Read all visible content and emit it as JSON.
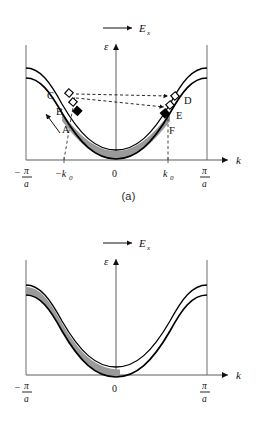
{
  "figure": {
    "panels": [
      {
        "id": "a",
        "caption": "(a)",
        "field_arrow_label": "E",
        "field_arrow_subscript": "x",
        "y_axis_label": "ε",
        "x_axis_label": "k",
        "x_ticks": [
          {
            "id": "neg-pi-a",
            "numerator": "π",
            "denominator": "a",
            "sign": "−",
            "type": "fraction"
          },
          {
            "id": "neg-k0",
            "label": "−k",
            "subscript": "0",
            "type": "symbol"
          },
          {
            "id": "zero",
            "label": "0",
            "type": "plain"
          },
          {
            "id": "pos-k0",
            "label": "k",
            "subscript": "0",
            "type": "symbol"
          },
          {
            "id": "pos-pi-a",
            "numerator": "π",
            "denominator": "a",
            "sign": "",
            "type": "fraction"
          }
        ],
        "point_labels": [
          "C",
          "B",
          "A",
          "D",
          "E",
          "F"
        ],
        "markers": {
          "open_square_count_left": 2,
          "filled_square_count_left": 1,
          "open_square_count_right": 2,
          "filled_square_count_right": 1
        },
        "dashed_transitions": [
          "C→D",
          "B→E"
        ],
        "shaded_region": "symmetric between −k0 and +k0"
      },
      {
        "id": "b",
        "caption": "(b)",
        "field_arrow_label": "E",
        "field_arrow_subscript": "x",
        "y_axis_label": "ε",
        "x_axis_label": "k",
        "x_ticks": [
          {
            "id": "neg-pi-a",
            "numerator": "π",
            "denominator": "a",
            "sign": "−",
            "type": "fraction"
          },
          {
            "id": "zero",
            "label": "0",
            "type": "plain"
          },
          {
            "id": "pos-pi-a",
            "numerator": "π",
            "denominator": "a",
            "sign": "",
            "type": "fraction"
          }
        ],
        "shaded_region": "left half only, from −π/a to slightly past 0"
      }
    ],
    "colors": {
      "band_fill": "#9a9a9a",
      "curve_stroke": "#000000",
      "axis_stroke": "#5a5a5a",
      "dashed_stroke": "#111111",
      "marker_open_fill": "#ffffff",
      "marker_filled_fill": "#000000",
      "background": "#ffffff"
    }
  }
}
